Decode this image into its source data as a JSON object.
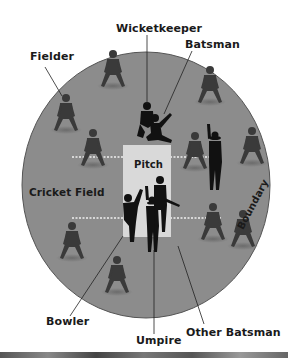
{
  "diagram": {
    "colors": {
      "field": "#8c8c8c",
      "boundary": "#555555",
      "pitch": "#d9d9d9",
      "crease_dash": "#f0f0f0",
      "silhouette_dark": "#111111",
      "silhouette_fielder": "#3a3a3a",
      "label": "#1a1a1a"
    },
    "labels": {
      "wicketkeeper": "Wicketkeeper",
      "batsman": "Batsman",
      "fielder": "Fielder",
      "pitch": "Pitch",
      "cricket_field": "Cricket Field",
      "boundary": "Boundary",
      "bowler": "Bowler",
      "umpire": "Umpire",
      "other_batsman": "Other Batsman"
    }
  }
}
